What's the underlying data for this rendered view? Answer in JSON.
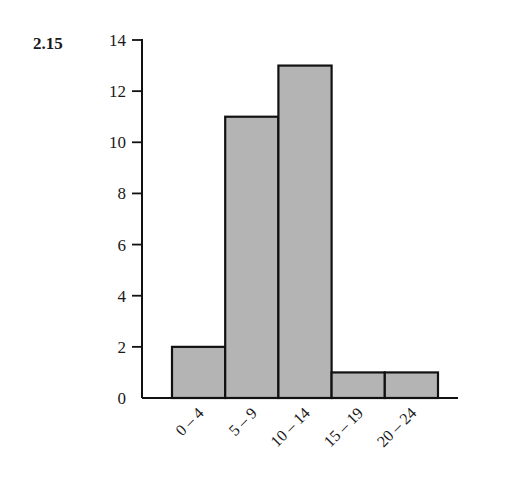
{
  "problem_number": "2.15",
  "chart_data": {
    "type": "bar",
    "title": "",
    "xlabel": "",
    "ylabel": "",
    "categories": [
      "0 – 4",
      "5 – 9",
      "10 – 14",
      "15 – 19",
      "20 – 24"
    ],
    "values": [
      2,
      11,
      13,
      1,
      1
    ],
    "ylim": [
      0,
      14
    ],
    "yticks": [
      0,
      2,
      4,
      6,
      8,
      10,
      12,
      14
    ],
    "grid": false,
    "legend": null,
    "bar_style": "histogram (adjacent bars, gray fill, black outline)",
    "colors": {
      "bar_fill": "#b4b4b4",
      "bar_stroke": "#111111",
      "axis": "#111111"
    }
  }
}
